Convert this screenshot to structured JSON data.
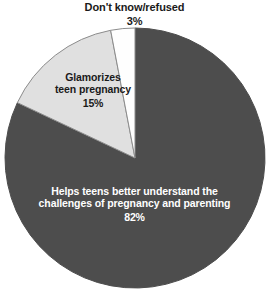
{
  "chart_data": {
    "type": "pie",
    "title": "",
    "subtitle": "",
    "xlabel": "",
    "ylabel": "",
    "legend_position": "none",
    "grid": false,
    "units": "percent",
    "start_angle_deg": 0,
    "direction": "clockwise",
    "categories": [
      "Helps teens better understand the challenges of pregnancy and parenting",
      "Glamorizes teen pregnancy",
      "Don't know/refused"
    ],
    "values": [
      82,
      15,
      3
    ],
    "colors": [
      "#4d4d4d",
      "#e0e0e0",
      "#fefefe"
    ],
    "slices": [
      {
        "id": "helps",
        "label_line1": "Helps teens better understand the",
        "label_line2": "challenges of pregnancy and parenting",
        "value": 82,
        "value_label": "82%",
        "color": "#4d4d4d",
        "stroke": "#4d4d4d",
        "text_color": "#ffffff",
        "label_placement": "inside"
      },
      {
        "id": "glamorizes",
        "label_line1": "Glamorizes",
        "label_line2": "teen pregnancy",
        "value": 15,
        "value_label": "15%",
        "color": "#e0e0e0",
        "stroke": "#8c8c8c",
        "text_color": "#1a1a1a",
        "label_placement": "inside"
      },
      {
        "id": "dontknow",
        "label_line1": "Don't know/refused",
        "label_line2": "",
        "value": 3,
        "value_label": "3%",
        "color": "#fefefe",
        "stroke": "#8c8c8c",
        "text_color": "#1a1a1a",
        "label_placement": "outside-top"
      }
    ],
    "geometry": {
      "center_x": 135,
      "center_y": 158,
      "radius": 130
    }
  },
  "labels": {
    "dontknow": {
      "text": "Don't know/refused",
      "percent": "3%"
    },
    "glamorizes": {
      "line1": "Glamorizes",
      "line2": "teen pregnancy",
      "percent": "15%"
    },
    "helps": {
      "line1": "Helps teens better understand the",
      "line2": "challenges of pregnancy and parenting",
      "percent": "82%"
    }
  }
}
